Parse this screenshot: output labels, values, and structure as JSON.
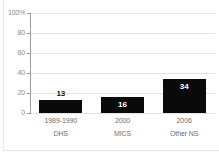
{
  "colors": {
    "background": "#ffffff",
    "bar": "#0a0a0a",
    "grid": "#e2e2e2",
    "axis": "#9a9a9a",
    "tick_text": "#8a8a8a",
    "xlabel_text": "#6e6e6e",
    "value_above": "#111111",
    "value_inside": "#ffffff",
    "panel_border": "#e9e9e9"
  },
  "chart_data": {
    "type": "bar",
    "title": "",
    "xlabel": "",
    "ylabel": "",
    "categories": [
      {
        "line1": "1989-1990",
        "line2": "DHS"
      },
      {
        "line1": "2000",
        "line2": "MICS"
      },
      {
        "line1": "2006",
        "line2": "Other NS"
      }
    ],
    "values": [
      13,
      16,
      34
    ],
    "value_labels": [
      "13",
      "16",
      "34"
    ],
    "value_label_position": [
      "above",
      "inside",
      "inside"
    ],
    "ylim": [
      0,
      100
    ],
    "yticks": {
      "values": [
        0,
        20,
        40,
        60,
        80,
        100
      ],
      "labels": [
        "0",
        "20",
        "40",
        "60",
        "80",
        "100%"
      ]
    },
    "grid": "horizontal",
    "legend": "none"
  }
}
